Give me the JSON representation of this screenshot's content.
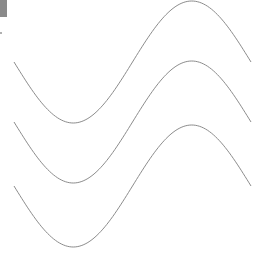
{
  "figure": {
    "line_color": "#8c8c8c",
    "corner_block_color": "#8a8a8a",
    "corner_tick_color": "#b0b0b0"
  },
  "waves": [
    {
      "name": "wave-1",
      "x_start": 14,
      "x_end": 251,
      "midline_y": 62,
      "amplitude": 61
    },
    {
      "name": "wave-2",
      "x_start": 14,
      "x_end": 251,
      "midline_y": 122,
      "amplitude": 61
    },
    {
      "name": "wave-3",
      "x_start": 14,
      "x_end": 251,
      "midline_y": 186,
      "amplitude": 61
    }
  ]
}
